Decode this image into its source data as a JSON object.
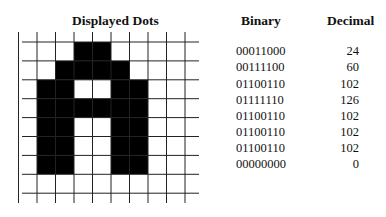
{
  "headers": {
    "dots": "Displayed Dots",
    "binary": "Binary",
    "decimal": "Decimal"
  },
  "colors": {
    "on": "#000000",
    "off": "#ffffff",
    "grid_line": "#222222"
  },
  "rows": [
    {
      "binary": "00011000",
      "decimal": "24"
    },
    {
      "binary": "00111100",
      "decimal": "60"
    },
    {
      "binary": "01100110",
      "decimal": "102"
    },
    {
      "binary": "01111110",
      "decimal": "126"
    },
    {
      "binary": "01100110",
      "decimal": "102"
    },
    {
      "binary": "01100110",
      "decimal": "102"
    },
    {
      "binary": "01100110",
      "decimal": "102"
    },
    {
      "binary": "00000000",
      "decimal": "0"
    }
  ]
}
